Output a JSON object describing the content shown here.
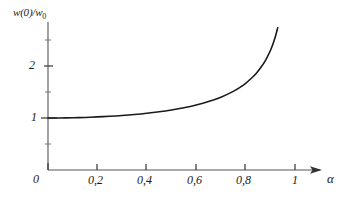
{
  "chart_data": {
    "type": "line",
    "title": "",
    "xlabel": "α",
    "ylabel": "w(0)/w",
    "ylabel_sub": "0",
    "xlim": [
      0,
      1.11
    ],
    "ylim": [
      0,
      2.85
    ],
    "grid": false,
    "legend": null,
    "xticks": [
      0,
      0.2,
      0.4,
      0.6,
      0.8,
      1
    ],
    "xticklabels": [
      "0",
      "0,2",
      "0,4",
      "0,6",
      "0,8",
      "1"
    ],
    "yticks": [
      1,
      2
    ],
    "yticklabels": [
      "1",
      "2"
    ],
    "yminorticks": [
      0.5,
      1.5,
      2.5
    ],
    "series": [
      {
        "name": "w(0)/w0 vs alpha",
        "x": [
          0.0,
          0.05,
          0.1,
          0.15,
          0.2,
          0.25,
          0.3,
          0.35,
          0.4,
          0.45,
          0.5,
          0.55,
          0.6,
          0.65,
          0.7,
          0.75,
          0.78,
          0.8,
          0.82,
          0.84,
          0.86,
          0.88,
          0.9,
          0.91,
          0.92,
          0.93
        ],
        "y": [
          1.0,
          1.001,
          1.005,
          1.011,
          1.021,
          1.033,
          1.048,
          1.067,
          1.091,
          1.12,
          1.155,
          1.197,
          1.25,
          1.316,
          1.4,
          1.512,
          1.598,
          1.667,
          1.75,
          1.842,
          1.961,
          2.105,
          2.294,
          2.415,
          2.557,
          2.733
        ]
      }
    ]
  },
  "axes": {
    "x_axis_name": "alpha-axis",
    "y_axis_name": "w-ratio-axis",
    "arrow": "right-arrow"
  },
  "style": {
    "curve_color": "#1a1a1a",
    "axis_color": "#555555",
    "background": "#ffffff"
  }
}
